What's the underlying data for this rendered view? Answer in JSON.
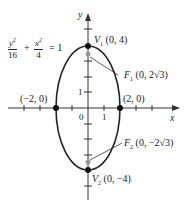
{
  "equation": {
    "term1_num": "y",
    "term1_num_exp": "2",
    "term1_den": "16",
    "plus": "+",
    "term2_num": "x",
    "term2_num_exp": "2",
    "term2_den": "4",
    "equals": "= 1"
  },
  "axes": {
    "x_label": "x",
    "y_label": "y",
    "origin_label": "0",
    "x_tick_label": "1",
    "y_tick_label": "1"
  },
  "points": {
    "v1": {
      "name": "V",
      "sub": "1",
      "coords": "(0, 4)"
    },
    "v2": {
      "name": "V",
      "sub": "2",
      "coords": "(0, −4)"
    },
    "f1": {
      "name": "F",
      "sub": "1",
      "coords_pre": "(0, 2",
      "radical": "√3",
      "coords_post": ")"
    },
    "f2": {
      "name": "F",
      "sub": "2",
      "coords_pre": "(0, −2",
      "radical": "√3",
      "coords_post": ")"
    },
    "left": {
      "coords": "(−2, 0)"
    },
    "right": {
      "coords": "(2, 0)"
    }
  },
  "colors": {
    "curve": "#222222",
    "focus": "#999999",
    "axis": "#333333"
  }
}
